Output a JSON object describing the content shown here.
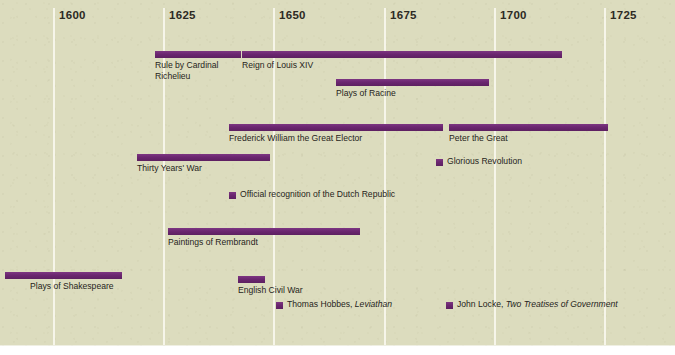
{
  "figure": {
    "name": "seventeenth-century-europe-timeline",
    "background_color": "#dcdcbe",
    "bar_color": "#6e2a72",
    "gridline_color": "#f6f5e9",
    "text_color": "#262420"
  },
  "chart_data": {
    "type": "bar",
    "orientation": "horizontal-timeline",
    "title": "",
    "subtitle": "",
    "xlabel": "",
    "ylabel": "",
    "xlim": [
      1588,
      1733
    ],
    "grid": true,
    "legend": "none",
    "axis_ticks": [
      {
        "label": "1600",
        "value": 1600,
        "x": 53
      },
      {
        "label": "1625",
        "value": 1625,
        "x": 163
      },
      {
        "label": "1650",
        "value": 1650,
        "x": 273
      },
      {
        "label": "1675",
        "value": 1675,
        "x": 384
      },
      {
        "label": "1700",
        "value": 1700,
        "x": 494
      },
      {
        "label": "1725",
        "value": 1725,
        "x": 604
      }
    ],
    "events": [
      {
        "label": "Rule by Cardinal Richelieu",
        "kind": "span",
        "start": 1624,
        "end": 1643,
        "x": 155,
        "w": 86,
        "y": 51,
        "label_x": 155,
        "label_y": 60,
        "wrap": true
      },
      {
        "label": "Reign of Louis XIV",
        "kind": "span",
        "start": 1643,
        "end": 1715,
        "x": 242,
        "w": 320,
        "y": 51,
        "label_x": 242,
        "label_y": 60,
        "wrap": false
      },
      {
        "label": "Plays of Racine",
        "kind": "span",
        "start": 1664,
        "end": 1699,
        "x": 336,
        "w": 153,
        "y": 79,
        "label_x": 336,
        "label_y": 88,
        "wrap": false
      },
      {
        "label": "Frederick William the Great Elector",
        "kind": "span",
        "start": 1640,
        "end": 1688,
        "x": 229,
        "w": 214,
        "y": 124,
        "label_x": 229,
        "label_y": 133,
        "wrap": false
      },
      {
        "label": "Peter the Great",
        "kind": "span",
        "start": 1689,
        "end": 1725,
        "x": 449,
        "w": 159,
        "y": 124,
        "label_x": 449,
        "label_y": 133,
        "wrap": false
      },
      {
        "label": "Thirty Years' War",
        "kind": "span",
        "start": 1618,
        "end": 1648,
        "x": 137,
        "w": 133,
        "y": 154,
        "label_x": 137,
        "label_y": 163,
        "wrap": false
      },
      {
        "label": "Glorious Revolution",
        "kind": "point",
        "start": 1688,
        "end": 1688,
        "x": 436,
        "w": 7,
        "y": 159,
        "label_x": 447,
        "label_y": 156,
        "wrap": false
      },
      {
        "label": "Official recognition of the Dutch Republic",
        "kind": "point",
        "start": 1648,
        "end": 1648,
        "x": 229,
        "w": 7,
        "y": 192,
        "label_x": 240,
        "label_y": 189,
        "wrap": false
      },
      {
        "label": "Paintings of Rembrandt",
        "kind": "span",
        "start": 1626,
        "end": 1670,
        "x": 168,
        "w": 192,
        "y": 228,
        "label_x": 168,
        "label_y": 237,
        "wrap": false
      },
      {
        "label": "Plays of Shakespeare",
        "kind": "span",
        "start": 1590,
        "end": 1616,
        "x": 5,
        "w": 117,
        "y": 272,
        "label_x": 30,
        "label_y": 281,
        "wrap": false
      },
      {
        "label": "English Civil War",
        "kind": "span",
        "start": 1642,
        "end": 1648,
        "x": 238,
        "w": 27,
        "y": 276,
        "label_x": 238,
        "label_y": 285,
        "wrap": false
      },
      {
        "label": "Thomas Hobbes, Leviathan",
        "label_plain": "Thomas Hobbes, ",
        "label_italic": "Leviathan",
        "kind": "point",
        "start": 1651,
        "end": 1651,
        "x": 276,
        "w": 7,
        "y": 302,
        "label_x": 287,
        "label_y": 299,
        "wrap": false
      },
      {
        "label": "John Locke, Two Treatises of Government",
        "label_plain": "John Locke, ",
        "label_italic": "Two Treatises of Government",
        "kind": "point",
        "start": 1690,
        "end": 1690,
        "x": 446,
        "w": 7,
        "y": 302,
        "label_x": 457,
        "label_y": 299,
        "wrap": false
      }
    ]
  }
}
